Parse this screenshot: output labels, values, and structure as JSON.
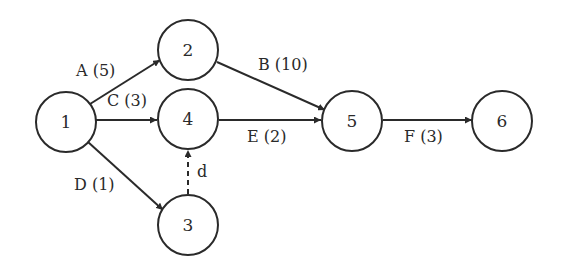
{
  "diagram": {
    "type": "activity-network",
    "nodes": [
      {
        "id": "1",
        "label": "1",
        "x": 66,
        "y": 122
      },
      {
        "id": "2",
        "label": "2",
        "x": 188,
        "y": 50
      },
      {
        "id": "4",
        "label": "4",
        "x": 188,
        "y": 119
      },
      {
        "id": "3",
        "label": "3",
        "x": 188,
        "y": 225
      },
      {
        "id": "5",
        "label": "5",
        "x": 352,
        "y": 121
      },
      {
        "id": "6",
        "label": "6",
        "x": 502,
        "y": 121
      }
    ],
    "edges": [
      {
        "from": "1",
        "to": "2",
        "activity": "A",
        "duration": 5,
        "label": "A (5)",
        "style": "solid"
      },
      {
        "from": "1",
        "to": "4",
        "activity": "C",
        "duration": 3,
        "label": "C (3)",
        "style": "solid"
      },
      {
        "from": "1",
        "to": "3",
        "activity": "D",
        "duration": 1,
        "label": "D (1)",
        "style": "solid"
      },
      {
        "from": "3",
        "to": "4",
        "activity": "d",
        "duration": null,
        "label": "d",
        "style": "dashed"
      },
      {
        "from": "2",
        "to": "5",
        "activity": "B",
        "duration": 10,
        "label": "B (10)",
        "style": "solid"
      },
      {
        "from": "4",
        "to": "5",
        "activity": "E",
        "duration": 2,
        "label": "E (2)",
        "style": "solid"
      },
      {
        "from": "5",
        "to": "6",
        "activity": "F",
        "duration": 3,
        "label": "F (3)",
        "style": "solid"
      }
    ],
    "colors": {
      "stroke": "#2a2a2a",
      "background": "#ffffff"
    }
  }
}
